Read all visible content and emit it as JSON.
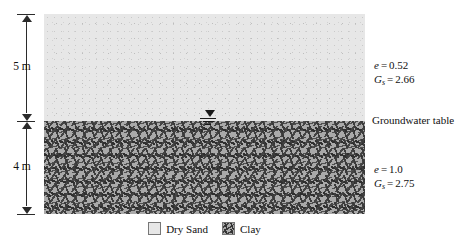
{
  "figure": {
    "type": "soil-profile-diagram",
    "layers": [
      {
        "name": "Dry Sand",
        "thickness_label": "5 m",
        "void_ratio_symbol": "e",
        "void_ratio_value": "0.52",
        "specific_gravity_symbol": "G",
        "specific_gravity_subscript": "s",
        "specific_gravity_value": "2.66",
        "equals": "=",
        "fill_color": "#e7e7e7"
      },
      {
        "name": "Clay",
        "thickness_label": "4 m",
        "void_ratio_symbol": "e",
        "void_ratio_value": "1.0",
        "specific_gravity_symbol": "G",
        "specific_gravity_subscript": "s",
        "specific_gravity_value": "2.75",
        "equals": "=",
        "fill_color": "#a9a9a9"
      }
    ],
    "groundwater": {
      "label": "Groundwater table",
      "symbol": "water-table-triangle"
    },
    "legend": {
      "items": [
        {
          "label": "Dry Sand",
          "swatch": "sand-swatch"
        },
        {
          "label": "Clay",
          "swatch": "clay-swatch"
        }
      ]
    },
    "colors": {
      "sand": "#e7e7e7",
      "clay": "#a9a9a9",
      "line": "#2b2b2b",
      "text": "#111111"
    }
  }
}
